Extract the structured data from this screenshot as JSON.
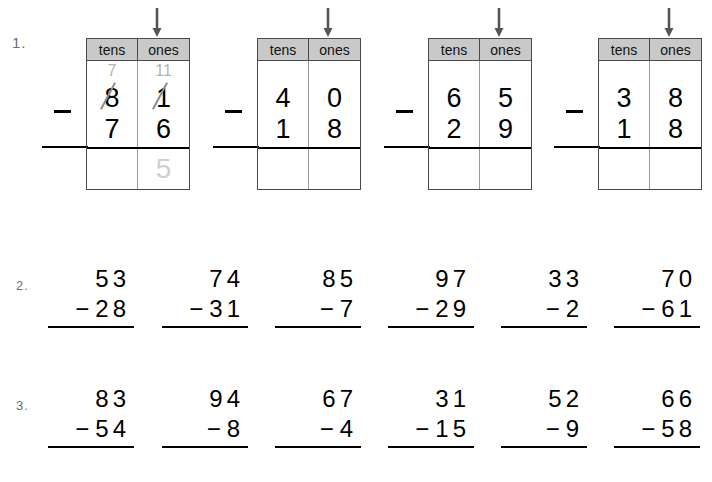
{
  "page": {
    "background_color": "#ffffff",
    "text_color": "#000000",
    "annotation_color": "#b4b4b4"
  },
  "exercises": [
    {
      "id": "1",
      "label": "1."
    },
    {
      "id": "2",
      "label": "2."
    },
    {
      "id": "3",
      "label": "3."
    }
  ],
  "row1": {
    "number_label": "1.",
    "column_headers": {
      "tens": "tens",
      "ones": "ones"
    },
    "arrow_icon": "down-arrow-icon",
    "operator": "−",
    "problems": [
      {
        "index": 0,
        "minuend_tens": "8",
        "minuend_ones": "1",
        "subtrahend_tens": "7",
        "subtrahend_ones": "6",
        "regroup_tens": "7",
        "regroup_ones": "11",
        "tens_crossed": true,
        "ones_crossed": true,
        "answer_tens": "",
        "answer_ones": "5",
        "answer_ones_is_trace": true,
        "worked_example": true
      },
      {
        "index": 1,
        "minuend_tens": "4",
        "minuend_ones": "0",
        "subtrahend_tens": "1",
        "subtrahend_ones": "8",
        "regroup_tens": "",
        "regroup_ones": "",
        "tens_crossed": false,
        "ones_crossed": false,
        "answer_tens": "",
        "answer_ones": "",
        "answer_ones_is_trace": false,
        "worked_example": false
      },
      {
        "index": 2,
        "minuend_tens": "6",
        "minuend_ones": "5",
        "subtrahend_tens": "2",
        "subtrahend_ones": "9",
        "regroup_tens": "",
        "regroup_ones": "",
        "tens_crossed": false,
        "ones_crossed": false,
        "answer_tens": "",
        "answer_ones": "",
        "answer_ones_is_trace": false,
        "worked_example": false
      },
      {
        "index": 3,
        "minuend_tens": "3",
        "minuend_ones": "8",
        "subtrahend_tens": "1",
        "subtrahend_ones": "8",
        "regroup_tens": "",
        "regroup_ones": "",
        "tens_crossed": false,
        "ones_crossed": false,
        "answer_tens": "",
        "answer_ones": "",
        "answer_ones_is_trace": false,
        "worked_example": false
      }
    ]
  },
  "row2": {
    "number_label": "2.",
    "operator": "−",
    "problems": [
      {
        "index": 0,
        "minuend": "53",
        "subtrahend": "28"
      },
      {
        "index": 1,
        "minuend": "74",
        "subtrahend": "31"
      },
      {
        "index": 2,
        "minuend": "85",
        "subtrahend": "7"
      },
      {
        "index": 3,
        "minuend": "97",
        "subtrahend": "29"
      },
      {
        "index": 4,
        "minuend": "33",
        "subtrahend": "2"
      },
      {
        "index": 5,
        "minuend": "70",
        "subtrahend": "61"
      }
    ]
  },
  "row3": {
    "number_label": "3.",
    "operator": "−",
    "problems": [
      {
        "index": 0,
        "minuend": "83",
        "subtrahend": "54"
      },
      {
        "index": 1,
        "minuend": "94",
        "subtrahend": "8"
      },
      {
        "index": 2,
        "minuend": "67",
        "subtrahend": "4"
      },
      {
        "index": 3,
        "minuend": "31",
        "subtrahend": "15"
      },
      {
        "index": 4,
        "minuend": "52",
        "subtrahend": "9"
      },
      {
        "index": 5,
        "minuend": "66",
        "subtrahend": "58"
      }
    ]
  }
}
